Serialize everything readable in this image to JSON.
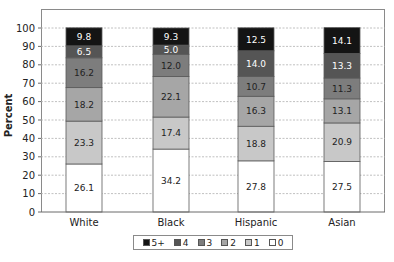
{
  "chart_data": {
    "type": "bar",
    "stacked": true,
    "title": "",
    "xlabel": "",
    "ylabel": "Percent",
    "ylim": [
      0,
      100
    ],
    "yticks": [
      0,
      10,
      20,
      30,
      40,
      50,
      60,
      70,
      80,
      90,
      100
    ],
    "grid": "horizontal dotted",
    "legend_position": "bottom",
    "categories": [
      "White",
      "Black",
      "Hispanic",
      "Asian"
    ],
    "series": [
      {
        "name": "0",
        "color": "#ffffff",
        "label_color": "#222222",
        "values": [
          26.1,
          34.2,
          27.8,
          27.5
        ]
      },
      {
        "name": "1",
        "color": "#c8c8c8",
        "label_color": "#222222",
        "values": [
          23.3,
          17.4,
          18.8,
          20.9
        ]
      },
      {
        "name": "2",
        "color": "#a6a6a6",
        "label_color": "#222222",
        "values": [
          18.2,
          22.1,
          16.3,
          13.1
        ]
      },
      {
        "name": "3",
        "color": "#7d7d7d",
        "label_color": "#222222",
        "values": [
          16.2,
          12.0,
          10.7,
          11.3
        ]
      },
      {
        "name": "4",
        "color": "#555555",
        "label_color": "#ffffff",
        "values": [
          6.5,
          5.0,
          14.0,
          13.3
        ]
      },
      {
        "name": "5+",
        "color": "#141414",
        "label_color": "#ffffff",
        "values": [
          9.8,
          9.3,
          12.5,
          14.1
        ]
      }
    ]
  },
  "legend": {
    "items": [
      {
        "label": "5+",
        "color": "#141414"
      },
      {
        "label": "4",
        "color": "#555555"
      },
      {
        "label": "3",
        "color": "#7d7d7d"
      },
      {
        "label": "2",
        "color": "#a6a6a6"
      },
      {
        "label": "1",
        "color": "#c8c8c8"
      },
      {
        "label": "0",
        "color": "#ffffff"
      }
    ]
  },
  "axis": {
    "ylabel": "Percent"
  }
}
